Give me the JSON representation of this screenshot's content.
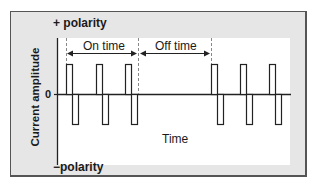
{
  "diagram": {
    "labels": {
      "positive_polarity": "+ polarity",
      "negative_polarity": "−polarity",
      "y_axis": "Current amplitude",
      "zero": "0",
      "x_axis": "Time",
      "on_time": "On time",
      "off_time": "Off time"
    },
    "colors": {
      "frame_bg": "#e6e6e6",
      "plot_bg": "#ffffff",
      "stroke": "#222222",
      "dashed": "#888888"
    },
    "pulse_groups": [
      {
        "phase": "on",
        "pulses": 3
      },
      {
        "phase": "off",
        "pulses": 0
      },
      {
        "phase": "on",
        "pulses": 3
      }
    ]
  }
}
